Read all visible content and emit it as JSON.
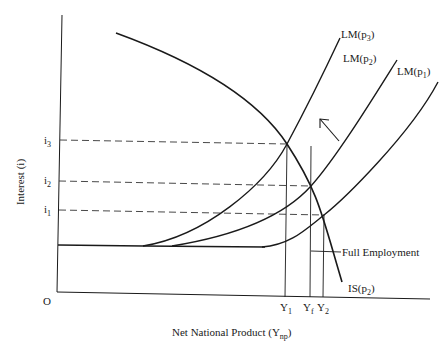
{
  "diagram": {
    "y_axis_label": "Interest (i)",
    "x_axis_label_main": "Net National Product (Y",
    "x_axis_label_sub": "np",
    "x_axis_label_close": ")",
    "origin_label": "O",
    "interest_levels": [
      {
        "base": "i",
        "sub": "3"
      },
      {
        "base": "i",
        "sub": "2"
      },
      {
        "base": "i",
        "sub": "1"
      }
    ],
    "output_levels": [
      {
        "base": "Y",
        "sub": "1"
      },
      {
        "base": "Y",
        "sub": "f"
      },
      {
        "base": "Y",
        "sub": "2"
      }
    ],
    "curves": {
      "lm3": {
        "base": "LM(p",
        "sub": "3",
        "close": ")"
      },
      "lm2": {
        "base": "LM(p",
        "sub": "2",
        "close": ")"
      },
      "lm1": {
        "base": "LM(p",
        "sub": "1",
        "close": ")"
      },
      "is": {
        "base": "IS(p",
        "sub": "2",
        "close": ")"
      }
    },
    "full_employment_label": "Full Employment",
    "line_color": "#1a1a1a"
  }
}
